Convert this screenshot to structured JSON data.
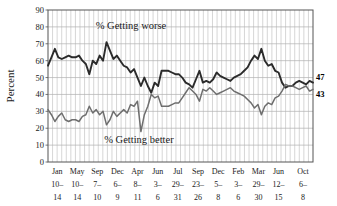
{
  "chart_data": {
    "type": "line",
    "title": "",
    "xlabel": "",
    "ylabel": "Percent",
    "ylim": [
      0,
      90
    ],
    "ytick_step": 10,
    "yticks": [
      0,
      10,
      20,
      30,
      40,
      50,
      60,
      70,
      80,
      90
    ],
    "grid": true,
    "grid_vertical_minor_count": 58,
    "legend_position": "inline-annotations",
    "annotations": [
      {
        "name": "worse-annotation",
        "text": "% Getting worse",
        "x_frac": 0.2,
        "y_value": 79
      },
      {
        "name": "better-annotation",
        "text": "% Getting better",
        "x_frac": 0.23,
        "y_value": 11
      }
    ],
    "end_labels": [
      {
        "name": "worse-end-label",
        "text": "47",
        "series": "% Getting worse",
        "value": 47
      },
      {
        "name": "better-end-label",
        "text": "43",
        "series": "% Getting better",
        "value": 43
      }
    ],
    "xtick_labels": [
      {
        "month": "Jan",
        "range": "10–",
        "end": "14"
      },
      {
        "month": "May",
        "range": "10–",
        "end": "14"
      },
      {
        "month": "Sep",
        "range": "7–",
        "end": "10"
      },
      {
        "month": "Dec",
        "range": "6–",
        "end": "9"
      },
      {
        "month": "Apr",
        "range": "8–",
        "end": "11"
      },
      {
        "month": "Jun",
        "range": "3–",
        "end": "6"
      },
      {
        "month": "Jul",
        "range": "29–",
        "end": "31"
      },
      {
        "month": "Sep",
        "range": "23–",
        "end": "26"
      },
      {
        "month": "Dec",
        "range": "5–",
        "end": "8"
      },
      {
        "month": "Feb",
        "range": "3–",
        "end": "6"
      },
      {
        "month": "Mar",
        "range": "29–",
        "end": "30"
      },
      {
        "month": "Jun",
        "range": "12–",
        "end": "15"
      },
      {
        "month": "Oct",
        "range": "6–",
        "end": "8"
      }
    ],
    "xtick_positions_frac": [
      0.035,
      0.11,
      0.186,
      0.262,
      0.338,
      0.414,
      0.49,
      0.566,
      0.642,
      0.718,
      0.794,
      0.87,
      0.962
    ],
    "series": [
      {
        "name": "% Getting worse",
        "color": "#2b2b2b",
        "values": [
          57,
          62,
          67,
          62,
          61,
          62,
          63,
          62,
          62,
          63,
          60,
          58,
          52,
          60,
          58,
          63,
          60,
          71,
          66,
          61,
          63,
          60,
          57,
          56,
          53,
          55,
          50,
          45,
          50,
          45,
          41,
          47,
          45,
          54,
          54,
          54,
          53,
          52,
          52,
          50,
          47,
          46,
          44,
          49,
          54,
          47,
          48,
          47,
          49,
          53,
          51,
          50,
          49,
          48,
          50,
          51,
          52,
          54,
          56,
          60,
          63,
          61,
          67,
          60,
          57,
          58,
          54,
          53,
          47,
          44,
          45,
          45,
          47,
          48,
          47,
          46,
          48,
          47
        ]
      },
      {
        "name": "% Getting better",
        "color": "#6e6e6e",
        "values": [
          31,
          28,
          24,
          27,
          29,
          25,
          24,
          25,
          25,
          24,
          27,
          28,
          33,
          29,
          31,
          28,
          30,
          22,
          25,
          30,
          27,
          29,
          31,
          29,
          34,
          33,
          36,
          18,
          28,
          33,
          40,
          38,
          39,
          33,
          33,
          33,
          34,
          35,
          35,
          38,
          41,
          44,
          42,
          40,
          36,
          43,
          42,
          44,
          42,
          40,
          41,
          42,
          43,
          44,
          42,
          41,
          40,
          39,
          37,
          35,
          32,
          34,
          28,
          33,
          35,
          34,
          38,
          39,
          42,
          46,
          45,
          45,
          44,
          43,
          44,
          45,
          42,
          43
        ]
      }
    ]
  }
}
